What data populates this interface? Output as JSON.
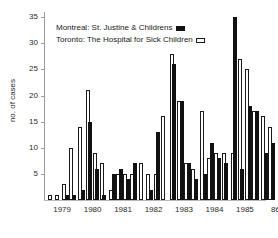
{
  "chart_data": {
    "type": "bar",
    "title": "",
    "subtitle": "",
    "xlabel": "",
    "ylabel": "no. of cases",
    "ylim": [
      0,
      36
    ],
    "xlim": [
      0,
      32
    ],
    "grid": false,
    "legend_position": "top-left",
    "y_ticks": [
      5,
      10,
      15,
      20,
      25,
      30,
      35
    ],
    "x_tick_labels": [
      "1979",
      "1980",
      "1981",
      "1982",
      "1983",
      "1984",
      "1985",
      "86"
    ],
    "categories": [
      "1979 Q1",
      "1979 Q2",
      "1979 Q3",
      "1979 Q4",
      "1980 Q1",
      "1980 Q2",
      "1980 Q3",
      "1980 Q4",
      "1981 Q1",
      "1981 Q2",
      "1981 Q3",
      "1981 Q4",
      "1982 Q1",
      "1982 Q2",
      "1982 Q3",
      "1982 Q4",
      "1983 Q1",
      "1983 Q2",
      "1983 Q3",
      "1983 Q4",
      "1984 Q1",
      "1984 Q2",
      "1984 Q3",
      "1984 Q4",
      "1985 Q1",
      "1985 Q2",
      "1985 Q3",
      "1985 Q4",
      "1986 Q1",
      "1986 Q2"
    ],
    "series": [
      {
        "name": "Toronto: The Hospital for Sick Children",
        "color": "#ffffff",
        "edge_color": "#1a1a1a",
        "values": [
          1,
          1,
          3,
          10,
          14,
          21,
          9,
          7,
          2,
          5,
          5,
          5,
          7,
          5,
          5,
          16,
          28,
          19,
          7,
          6,
          17,
          8,
          9,
          9,
          9,
          27,
          25,
          17,
          16,
          14
        ]
      },
      {
        "name": "Montreal: St. Justine & Childrens",
        "color": "#111111",
        "edge_color": "#111111",
        "values": [
          0,
          0,
          1,
          1,
          2,
          15,
          6,
          1,
          5,
          6,
          4,
          7,
          0,
          2,
          13,
          0,
          26,
          19,
          7,
          4,
          5,
          11,
          8,
          7,
          35,
          6,
          18,
          17,
          9,
          11
        ]
      }
    ]
  },
  "legend": {
    "rows": [
      {
        "label": "Montreal: St. Justine & Childrens",
        "swatch": "filled-square-icon"
      },
      {
        "label": "Toronto: The Hospital for Sick Children",
        "swatch": "open-square-icon"
      }
    ]
  },
  "axis": {
    "y_title": "no. of cases",
    "y_tick_labels": [
      "35",
      "30",
      "25",
      "20",
      "15",
      "10",
      "5"
    ],
    "x_tick_labels": [
      "1979",
      "1980",
      "1981",
      "1982",
      "1983",
      "1984",
      "1985",
      "86"
    ]
  }
}
